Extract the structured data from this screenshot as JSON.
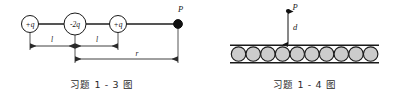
{
  "figures": [
    {
      "id": "problem-1-3",
      "caption": "习题 1 - 3 图",
      "type": "point-charge-line-diagram",
      "charges": [
        {
          "label": "+q",
          "x": 30,
          "y": 24
        },
        {
          "label": "-2q",
          "x": 75,
          "y": 24
        },
        {
          "label": "+q",
          "x": 118,
          "y": 24
        }
      ],
      "field_point": {
        "label": "P",
        "x": 178,
        "y": 24
      },
      "dimensions": [
        {
          "label": "l",
          "from_x": 30,
          "to_x": 75,
          "y": 46
        },
        {
          "label": "l",
          "from_x": 75,
          "to_x": 118,
          "y": 46
        },
        {
          "label": "r",
          "from_x": 75,
          "to_x": 178,
          "y": 59
        }
      ]
    },
    {
      "id": "problem-1-4",
      "caption": "习题 1 - 4 图",
      "type": "charged-sphere-row-diagram",
      "field_point": {
        "label": "P"
      },
      "distance": {
        "label": "d"
      },
      "sphere_count": 10,
      "sphere_fill": "#cccccc",
      "sphere_stroke": "#1a1a1a"
    }
  ]
}
